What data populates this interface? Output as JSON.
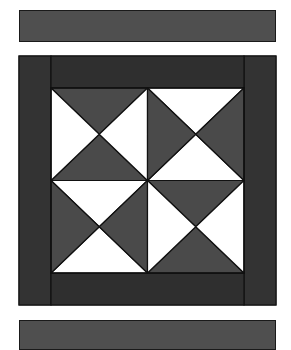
{
  "figure": {
    "colors": {
      "background": "#ffffff",
      "border_dark": "#2e2e2e",
      "triangle_dark": "#4a4a4a",
      "triangle_light": "#ffffff",
      "strip": "#4f4f4f",
      "outline": "#111111"
    },
    "quadrants": [
      {
        "position": "top-left",
        "dark_triangles": [
          "top",
          "bottom"
        ],
        "light_triangles": [
          "left",
          "right"
        ]
      },
      {
        "position": "top-right",
        "dark_triangles": [
          "left",
          "right"
        ],
        "light_triangles": [
          "top",
          "bottom"
        ]
      },
      {
        "position": "bottom-left",
        "dark_triangles": [
          "left",
          "right"
        ],
        "light_triangles": [
          "top",
          "bottom"
        ]
      },
      {
        "position": "bottom-right",
        "dark_triangles": [
          "top",
          "bottom"
        ],
        "light_triangles": [
          "left",
          "right"
        ]
      }
    ]
  }
}
